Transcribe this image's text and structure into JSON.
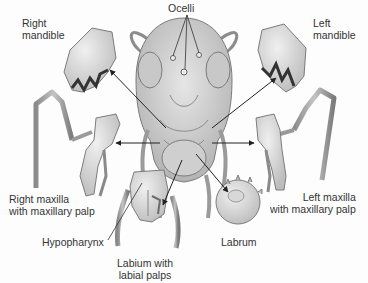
{
  "diagram": {
    "colors": {
      "part_fill": "#d9d9d9",
      "part_shade": "#a9a9a9",
      "part_dark": "#555555",
      "arrow": "#222222",
      "label_text": "#333333"
    },
    "labels": {
      "ocelli": {
        "text": "Ocelli"
      },
      "right_mandible": {
        "line1": "Right",
        "line2": "mandible"
      },
      "left_mandible": {
        "line1": "Left",
        "line2": "mandible"
      },
      "right_maxilla": {
        "line1": "Right maxilla",
        "line2": "with maxillary palp"
      },
      "left_maxilla": {
        "line1": "Left maxilla",
        "line2": "with maxillary palp"
      },
      "hypopharynx": {
        "text": "Hypopharynx"
      },
      "labium": {
        "line1": "Labium with",
        "line2": "labial palps"
      },
      "labrum": {
        "text": "Labrum"
      }
    },
    "parts": [
      "head",
      "antennae",
      "compound-eyes",
      "ocelli",
      "right-mandible",
      "left-mandible",
      "right-maxilla",
      "left-maxilla",
      "labium",
      "hypopharynx",
      "labrum"
    ],
    "arrows": [
      {
        "from": "head",
        "to": "right-mandible"
      },
      {
        "from": "head",
        "to": "left-mandible"
      },
      {
        "from": "head",
        "to": "right-maxilla"
      },
      {
        "from": "head",
        "to": "left-maxilla"
      },
      {
        "from": "head",
        "to": "labium"
      },
      {
        "from": "head",
        "to": "labrum"
      }
    ]
  }
}
